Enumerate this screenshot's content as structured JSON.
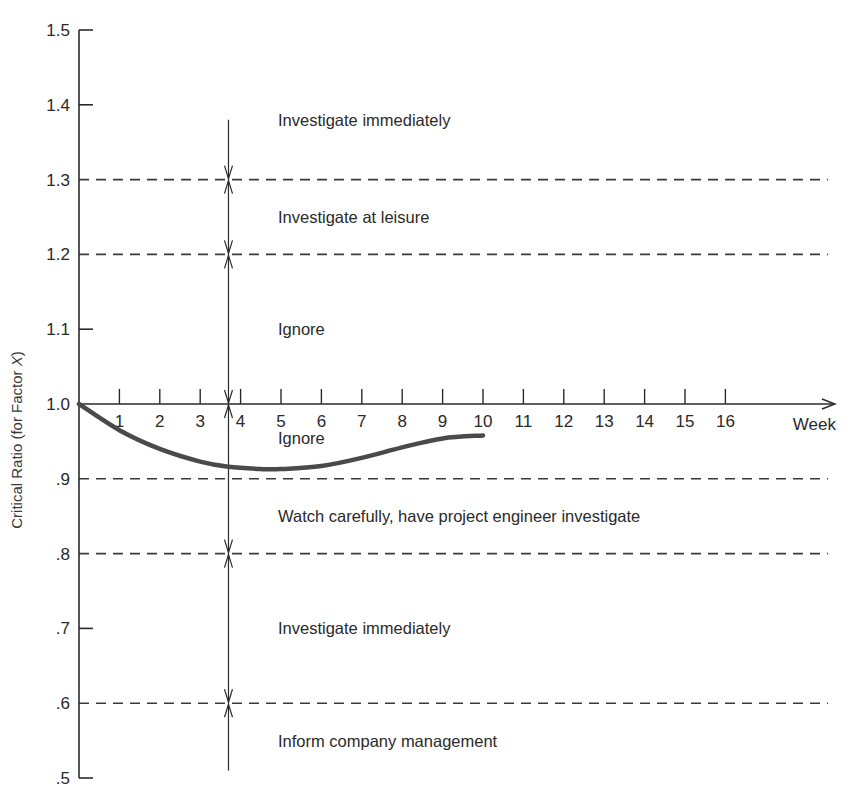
{
  "chart_data": {
    "type": "line",
    "title": "",
    "xlabel": "Week",
    "ylabel": "Critical Ratio (for Factor X)",
    "ylabel_parts": [
      "Critical Ratio (for Factor ",
      "X",
      ")"
    ],
    "xlim": [
      0,
      17
    ],
    "ylim": [
      0.5,
      1.5
    ],
    "grid": false,
    "legend": null,
    "x_ticks": [
      1,
      2,
      3,
      4,
      5,
      6,
      7,
      8,
      9,
      10,
      11,
      12,
      13,
      14,
      15,
      16
    ],
    "x_tick_labels": [
      "1",
      "2",
      "3",
      "4",
      "5",
      "6",
      "7",
      "8",
      "9",
      "10",
      "11",
      "12",
      "13",
      "14",
      "15",
      "16"
    ],
    "y_ticks": [
      1.5,
      1.4,
      1.3,
      1.2,
      1.1,
      1.0,
      0.9,
      0.8,
      0.7,
      0.6,
      0.5
    ],
    "y_tick_labels": [
      "1.5",
      "1.4",
      "1.3",
      "1.2",
      "1.1",
      "1.0",
      ".9",
      ".8",
      ".7",
      ".6",
      ".5"
    ],
    "threshold_lines": [
      1.3,
      1.2,
      0.9,
      0.8,
      0.6
    ],
    "series": [
      {
        "name": "Critical ratio",
        "color": "#4a4a4a",
        "x": [
          0,
          1,
          2,
          3,
          3.7,
          4.5,
          5,
          6,
          7,
          8,
          9,
          10
        ],
        "y": [
          1.0,
          0.965,
          0.94,
          0.923,
          0.916,
          0.913,
          0.913,
          0.917,
          0.928,
          0.942,
          0.954,
          0.958
        ]
      }
    ],
    "zones": [
      {
        "label": "Investigate immediately",
        "y": 1.38
      },
      {
        "label": "Investigate at leisure",
        "y": 1.25
      },
      {
        "label": "Ignore",
        "y": 1.1
      },
      {
        "label": "Ignore",
        "y": 0.955
      },
      {
        "label": "Watch carefully, have project engineer investigate",
        "y": 0.85
      },
      {
        "label": "Investigate immediately",
        "y": 0.7
      },
      {
        "label": "Inform company management",
        "y": 0.55
      }
    ],
    "annotations": {
      "range_arrow_week": 3.7,
      "range_arrow_top": 1.38,
      "range_arrow_bottom": 0.51
    }
  },
  "colors": {
    "axis": "#2a2a2a",
    "dash": "#3a3a3a",
    "curve": "#4a4a4a",
    "text": "#2a2a2a"
  }
}
